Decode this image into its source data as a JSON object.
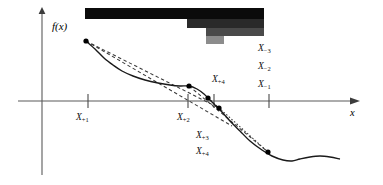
{
  "figure": {
    "type": "math-diagram",
    "axes": {
      "y_axis_label": "f(x)",
      "x_axis_label": "x"
    },
    "tick_labels_below_axis": [
      {
        "name": "x-tick-label-1",
        "text": "X",
        "sub": "+1",
        "x": 76,
        "y": 112
      },
      {
        "name": "x-tick-label-2",
        "text": "X",
        "sub": "+2",
        "x": 177,
        "y": 112
      },
      {
        "name": "x-tick-label-3",
        "text": "X",
        "sub": "+3",
        "x": 196,
        "y": 130
      },
      {
        "name": "x-tick-label-4",
        "text": "X",
        "sub": "+4",
        "x": 196,
        "y": 146
      }
    ],
    "tick_labels_above_axis": [
      {
        "name": "x-label-plus-4",
        "text": "X",
        "sub": "+4",
        "x": 212,
        "y": 74
      }
    ],
    "right_labels": [
      {
        "name": "x-label-minus-3",
        "text": "X",
        "sub": "−3",
        "x": 258,
        "y": 43
      },
      {
        "name": "x-label-minus-2",
        "text": "X",
        "sub": "−2",
        "x": 258,
        "y": 61
      },
      {
        "name": "x-label-minus-1",
        "text": "X",
        "sub": "−1",
        "x": 258,
        "y": 79
      }
    ],
    "redaction_bars": [
      {
        "name": "redaction-bar-1",
        "x": 85,
        "y": 8,
        "width": 179,
        "height": 11,
        "color": "#0b0b0b"
      },
      {
        "name": "redaction-bar-2",
        "x": 187,
        "y": 19,
        "width": 77,
        "height": 9,
        "color": "#2a2a2a"
      },
      {
        "name": "redaction-bar-3",
        "x": 206,
        "y": 28,
        "width": 58,
        "height": 8,
        "color": "#4a4a4a"
      },
      {
        "name": "redaction-bar-4",
        "x": 206,
        "y": 36,
        "width": 18,
        "height": 8,
        "color": "#8c8c8c"
      }
    ],
    "colors": {
      "curve": "#1a1a1a",
      "axis": "#4d4d4d",
      "dashed": "#3a3a3a",
      "marker": "#000000"
    },
    "axis_geometry": {
      "x_axis_y": 101,
      "x_axis_x_start": 18,
      "x_axis_x_end": 350,
      "y_axis_x": 42,
      "y_axis_y_top": 14,
      "y_axis_y_bottom": 175,
      "tick_positions_x": [
        88,
        188,
        214,
        269
      ],
      "tick_half_height": 7
    },
    "curve_points": [
      {
        "name": "marker-start",
        "x": 86,
        "y": 41
      },
      {
        "name": "marker-mid-1",
        "x": 189,
        "y": 86
      },
      {
        "name": "marker-mid-2",
        "x": 208,
        "y": 98
      },
      {
        "name": "marker-mid-3",
        "x": 219,
        "y": 108
      },
      {
        "name": "marker-end",
        "x": 268,
        "y": 152
      }
    ]
  },
  "chart_data": {
    "type": "line",
    "title": "",
    "xlabel": "x",
    "ylabel": "f(x)",
    "series": [
      {
        "name": "f(x)",
        "style": "solid",
        "points": [
          [
            86,
            41
          ],
          [
            95,
            49
          ],
          [
            104,
            58
          ],
          [
            113,
            65
          ],
          [
            122,
            71
          ],
          [
            133,
            76
          ],
          [
            145,
            80
          ],
          [
            158,
            83
          ],
          [
            170,
            85
          ],
          [
            180,
            86
          ],
          [
            189,
            86
          ],
          [
            197,
            89
          ],
          [
            204,
            94
          ],
          [
            210,
            100
          ],
          [
            216,
            106
          ],
          [
            222,
            112
          ],
          [
            230,
            121
          ],
          [
            240,
            131
          ],
          [
            250,
            141
          ],
          [
            262,
            150
          ],
          [
            272,
            156
          ],
          [
            283,
            160
          ],
          [
            292,
            161
          ],
          [
            300,
            159
          ],
          [
            310,
            157
          ],
          [
            320,
            156
          ],
          [
            330,
            157
          ],
          [
            340,
            159
          ]
        ]
      },
      {
        "name": "secant-1",
        "style": "dashed",
        "points": [
          [
            86,
            41
          ],
          [
            232,
            126
          ]
        ]
      },
      {
        "name": "secant-2",
        "style": "dashed",
        "points": [
          [
            86,
            41
          ],
          [
            219,
            108
          ]
        ]
      },
      {
        "name": "secant-3",
        "style": "dashed",
        "points": [
          [
            189,
            86
          ],
          [
            268,
            152
          ]
        ]
      },
      {
        "name": "secant-4",
        "style": "dotted",
        "points": [
          [
            208,
            98
          ],
          [
            268,
            152
          ]
        ]
      }
    ],
    "markers": [
      [
        86,
        41
      ],
      [
        189,
        86
      ],
      [
        208,
        98
      ],
      [
        219,
        108
      ],
      [
        268,
        152
      ]
    ],
    "grid": false,
    "legend": "none"
  }
}
